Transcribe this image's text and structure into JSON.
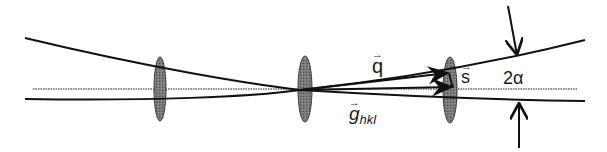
{
  "diagram": {
    "type": "beam-ray-diagram",
    "labels": {
      "q": "q",
      "s": "s",
      "two_alpha": "2α",
      "g_main": "g",
      "g_sub": "hkl",
      "vector_arrow": "→"
    },
    "elements": {
      "lenses": [
        {
          "name": "lens-1",
          "cx": 160,
          "cy": 89,
          "rx": 6,
          "ry": 32
        },
        {
          "name": "lens-2",
          "cx": 305,
          "cy": 89,
          "rx": 7,
          "ry": 33
        },
        {
          "name": "lens-3",
          "cx": 450,
          "cy": 90,
          "rx": 7,
          "ry": 33
        }
      ],
      "rays": [
        {
          "name": "upper-ray",
          "path": "M25,38 C150,68 250,84 300,90 Q450,74 585,40"
        },
        {
          "name": "lower-ray",
          "path": "M25,99 C150,101 250,97 300,90 Q450,99 585,101"
        },
        {
          "name": "optical-axis",
          "x1": 33,
          "y1": 89,
          "x2": 578,
          "y2": 89
        }
      ],
      "vectors": [
        {
          "name": "q-vector",
          "from": [
            300,
            90
          ],
          "to": [
            448,
            73
          ]
        },
        {
          "name": "g-hkl-vector",
          "from": [
            300,
            90
          ],
          "to": [
            452,
            87
          ]
        },
        {
          "name": "s-vector",
          "from": [
            449,
            73
          ],
          "to": [
            452,
            86
          ]
        }
      ],
      "angle_markers": [
        {
          "name": "top-arrow",
          "from": [
            508,
            6
          ],
          "to": [
            517,
            55
          ]
        },
        {
          "name": "bottom-arrow",
          "from": [
            519,
            148
          ],
          "to": [
            519,
            103
          ]
        }
      ]
    },
    "colors": {
      "line": "#111111",
      "lens_fill": "#6e6e6e",
      "lens_stroke": "#3a3a3a",
      "axis": "#9a9a9a"
    }
  }
}
